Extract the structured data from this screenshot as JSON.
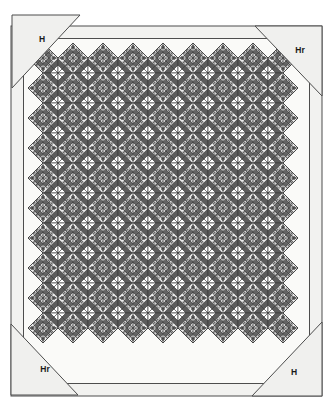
{
  "diagram": {
    "type": "quilt-setting-diagram",
    "canvas": {
      "width": 333,
      "height": 414
    },
    "background_color": "#ffffff"
  },
  "corner_labels": [
    {
      "id": "top-left",
      "text": "H",
      "x": 42,
      "y": 40
    },
    {
      "id": "top-right",
      "text": "Hr",
      "x": 300,
      "y": 51
    },
    {
      "id": "bottom-left",
      "text": "Hr",
      "x": 45,
      "y": 370
    },
    {
      "id": "bottom-right",
      "text": "H",
      "x": 294,
      "y": 373
    }
  ],
  "corner_triangles": [
    {
      "id": "corner-triangle-top-left",
      "points": "12,15 80,15 12,88",
      "label": "H"
    },
    {
      "id": "corner-triangle-top-right",
      "points": "255,26 322,26 322,96",
      "label": "Hr"
    },
    {
      "id": "corner-triangle-bottom-left",
      "points": "11,324 11,395 78,395",
      "label": "Hr"
    },
    {
      "id": "corner-triangle-bottom-right",
      "points": "322,322 322,396 252,396",
      "label": "H"
    }
  ],
  "border_frames": [
    {
      "id": "outer-frame",
      "x": 11,
      "y": 26,
      "width": 311,
      "height": 370,
      "stroke": "#4d4d4d"
    },
    {
      "id": "inner-frame",
      "x": 23.5,
      "y": 38.5,
      "width": 286,
      "height": 345,
      "stroke": "#4d4d4d"
    }
  ],
  "quilt_field": {
    "id": "pieced-center",
    "origin_x": 28,
    "origin_y": 43,
    "block_size": 30,
    "columns": 9,
    "rows": 11,
    "edge_style": "sawtooth",
    "description": "Repeating on-point pieced blocks with zigzag sawtooth outer edge"
  },
  "palette": {
    "paper": "#ffffff",
    "border_fill": "#f2f2f0",
    "triangle_fill": "#f0f0ee",
    "line": "#4d4d4d",
    "dark_grey": "#5c5c5c",
    "mid_grey": "#8a8a8a",
    "light_grey": "#c9c9c9",
    "speckle_grey": "#9e9e9e",
    "white_patch": "#ffffff",
    "seam": "#3a3a3a",
    "label_text": "#1a1a1a"
  },
  "legend_keys": [
    "H",
    "Hr"
  ]
}
